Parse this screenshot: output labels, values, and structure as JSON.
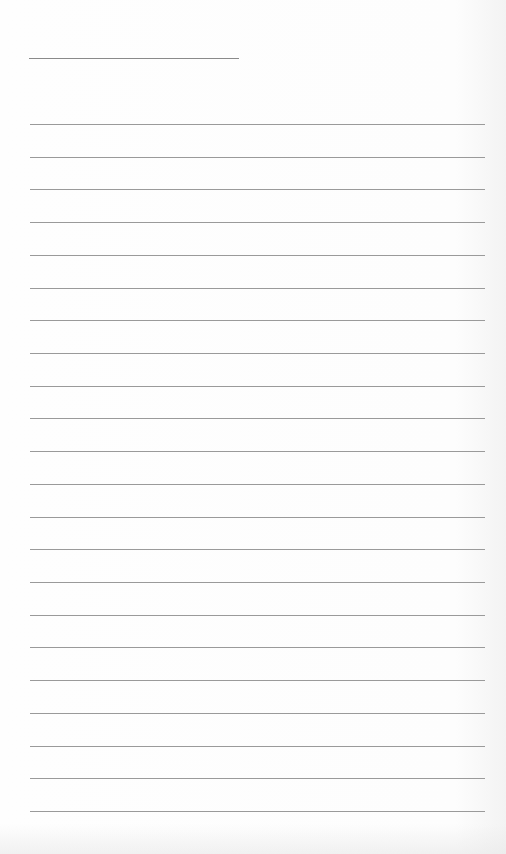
{
  "page": {
    "type": "lined-paper",
    "background_color": "#fdfdfd",
    "line_color": "#9a9a9a",
    "title_line": {
      "present": true,
      "text": ""
    },
    "ruled_lines_count": 22,
    "ruled_lines": [
      "",
      "",
      "",
      "",
      "",
      "",
      "",
      "",
      "",
      "",
      "",
      "",
      "",
      "",
      "",
      "",
      "",
      "",
      "",
      "",
      "",
      ""
    ]
  }
}
